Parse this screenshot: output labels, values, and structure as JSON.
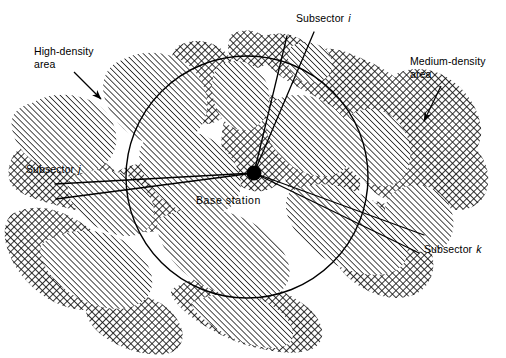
{
  "figure": {
    "type": "technical-diagram",
    "background_color": "#ffffff",
    "line_color": "#000000"
  },
  "labels": {
    "high_density": {
      "line1": "High-density",
      "line2": "area"
    },
    "medium_density": {
      "line1": "Medium-density",
      "line2": "area"
    },
    "subsector_i": {
      "text": "Subsector",
      "symbol": "i"
    },
    "subsector_j": {
      "text": "Subsector",
      "symbol": "j"
    },
    "subsector_k": {
      "text": "Subsector",
      "symbol": "k"
    },
    "base_station": {
      "text": "Base  station"
    }
  },
  "geometry": {
    "cell_circle": {
      "cx": 247,
      "cy": 177,
      "r": 121
    },
    "base_station_marker": {
      "cx": 254,
      "cy": 173,
      "r": 7
    },
    "subsector_i_lines": [
      {
        "x1": 287,
        "y1": 36,
        "x2": 254,
        "y2": 173
      },
      {
        "x1": 314,
        "y1": 32,
        "x2": 254,
        "y2": 173
      }
    ],
    "subsector_j_lines": [
      {
        "x1": 55,
        "y1": 184,
        "x2": 254,
        "y2": 173
      },
      {
        "x1": 56,
        "y1": 199,
        "x2": 254,
        "y2": 173
      }
    ],
    "subsector_k_lines": [
      {
        "x1": 254,
        "y1": 173,
        "x2": 424,
        "y2": 235
      },
      {
        "x1": 254,
        "y1": 173,
        "x2": 419,
        "y2": 253
      }
    ],
    "arrow_high_density": {
      "x1": 74,
      "y1": 72,
      "x2": 102,
      "y2": 100
    },
    "arrow_medium_density": {
      "x1": 441,
      "y1": 86,
      "x2": 423,
      "y2": 123
    }
  },
  "patterns": {
    "high_density_fill": "diagonal-hatch",
    "medium_density_fill": "cross-hatch",
    "hatch_color": "#000000",
    "hatch_spacing_px": 4,
    "crosshatch_spacing_px": 5
  }
}
